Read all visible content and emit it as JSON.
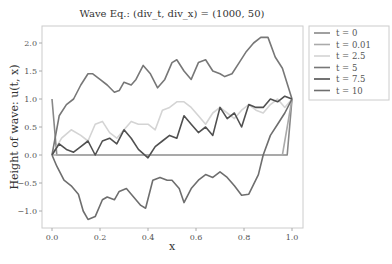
{
  "chart_data": {
    "type": "line",
    "title": "Wave Eq.: (div_t, div_x) = (1000, 50)",
    "xlabel": "x",
    "ylabel": "Height of wave: u(t, x)",
    "xlim": [
      -0.04,
      1.04
    ],
    "ylim": [
      -1.3,
      2.3
    ],
    "xticks": [
      0.0,
      0.2,
      0.4,
      0.6,
      0.8,
      1.0
    ],
    "xtick_labels": [
      "0.0",
      "0.2",
      "0.4",
      "0.6",
      "0.8",
      "1.0"
    ],
    "yticks": [
      2.0,
      1.5,
      1.0,
      0.5,
      0.0,
      -0.5,
      -1.0
    ],
    "ytick_labels": [
      "2.0",
      "1.5",
      "1.0",
      "0.5",
      "0.0",
      "−0.5",
      "−1.0"
    ],
    "grid": false,
    "legend_position": "outside upper right",
    "series": [
      {
        "name": "t = 0",
        "color": "#888888",
        "x": [
          0.0,
          0.02,
          0.98,
          1.0
        ],
        "y": [
          1.0,
          0.0,
          0.0,
          1.0
        ]
      },
      {
        "name": "t = 0.01",
        "color": "#aaaaaa",
        "x": [
          0.0,
          0.04,
          0.96,
          1.0
        ],
        "y": [
          0.0,
          0.0,
          0.0,
          1.0
        ]
      },
      {
        "name": "t = 2.5",
        "color": "#d4d4d4",
        "x": [
          0.0,
          0.04,
          0.08,
          0.12,
          0.15,
          0.18,
          0.21,
          0.24,
          0.27,
          0.3,
          0.33,
          0.36,
          0.4,
          0.43,
          0.46,
          0.49,
          0.52,
          0.55,
          0.58,
          0.61,
          0.64,
          0.67,
          0.7,
          0.73,
          0.76,
          0.79,
          0.82,
          0.85,
          0.88,
          0.91,
          0.94,
          0.97,
          1.0
        ],
        "y": [
          0.0,
          0.3,
          0.45,
          0.35,
          0.25,
          0.55,
          0.6,
          0.4,
          0.3,
          0.45,
          0.6,
          0.55,
          0.55,
          0.45,
          0.8,
          0.85,
          0.95,
          0.95,
          0.85,
          0.7,
          0.55,
          0.75,
          0.85,
          0.75,
          0.65,
          0.8,
          0.9,
          0.8,
          0.75,
          0.9,
          1.0,
          0.85,
          1.0
        ]
      },
      {
        "name": "t = 5",
        "color": "#777777",
        "x": [
          0.0,
          0.03,
          0.06,
          0.09,
          0.12,
          0.15,
          0.17,
          0.2,
          0.23,
          0.26,
          0.28,
          0.3,
          0.33,
          0.35,
          0.38,
          0.41,
          0.44,
          0.47,
          0.5,
          0.52,
          0.55,
          0.58,
          0.61,
          0.64,
          0.67,
          0.7,
          0.72,
          0.75,
          0.78,
          0.81,
          0.84,
          0.87,
          0.9,
          0.93,
          0.96,
          1.0
        ],
        "y": [
          0.0,
          0.7,
          0.9,
          1.0,
          1.25,
          1.45,
          1.45,
          1.35,
          1.25,
          1.12,
          1.15,
          1.3,
          1.25,
          1.35,
          1.6,
          1.45,
          1.2,
          1.35,
          1.65,
          1.7,
          1.5,
          1.35,
          1.65,
          1.7,
          1.5,
          1.45,
          1.4,
          1.45,
          1.65,
          1.85,
          2.0,
          2.1,
          2.1,
          1.75,
          1.55,
          1.0
        ]
      },
      {
        "name": "t = 7.5",
        "color": "#505050",
        "x": [
          0.0,
          0.03,
          0.06,
          0.09,
          0.12,
          0.15,
          0.18,
          0.21,
          0.24,
          0.27,
          0.3,
          0.33,
          0.36,
          0.4,
          0.43,
          0.46,
          0.49,
          0.52,
          0.55,
          0.58,
          0.61,
          0.64,
          0.67,
          0.7,
          0.73,
          0.76,
          0.79,
          0.82,
          0.85,
          0.88,
          0.91,
          0.94,
          0.97,
          1.0
        ],
        "y": [
          0.0,
          0.2,
          0.1,
          0.05,
          0.15,
          0.25,
          0.0,
          0.25,
          0.3,
          0.2,
          0.45,
          0.3,
          0.1,
          -0.05,
          0.15,
          0.25,
          0.35,
          0.3,
          0.7,
          0.55,
          0.4,
          0.5,
          0.35,
          0.85,
          0.65,
          0.75,
          0.5,
          0.9,
          0.85,
          0.85,
          1.0,
          0.95,
          1.05,
          1.0
        ]
      },
      {
        "name": "t = 10",
        "color": "#6e6e6e",
        "x": [
          0.0,
          0.02,
          0.05,
          0.08,
          0.11,
          0.13,
          0.15,
          0.18,
          0.21,
          0.23,
          0.26,
          0.28,
          0.31,
          0.34,
          0.37,
          0.39,
          0.42,
          0.45,
          0.48,
          0.5,
          0.53,
          0.55,
          0.58,
          0.61,
          0.64,
          0.67,
          0.7,
          0.73,
          0.76,
          0.79,
          0.82,
          0.86,
          0.88,
          0.91,
          0.94,
          0.97,
          1.0
        ],
        "y": [
          0.0,
          -0.2,
          -0.45,
          -0.55,
          -0.7,
          -1.0,
          -1.15,
          -1.1,
          -0.8,
          -0.75,
          -0.8,
          -0.65,
          -0.6,
          -0.75,
          -0.9,
          -0.95,
          -0.45,
          -0.4,
          -0.45,
          -0.45,
          -0.6,
          -0.85,
          -0.6,
          -0.45,
          -0.35,
          -0.4,
          -0.3,
          -0.4,
          -0.55,
          -0.72,
          -0.7,
          -0.35,
          0.0,
          0.35,
          0.55,
          0.75,
          1.0
        ]
      }
    ]
  },
  "legend": {
    "items": [
      {
        "label": "t = 0",
        "color": "#888888"
      },
      {
        "label": "t = 0.01",
        "color": "#aaaaaa"
      },
      {
        "label": "t = 2.5",
        "color": "#d4d4d4"
      },
      {
        "label": "t = 5",
        "color": "#777777"
      },
      {
        "label": "t = 7.5",
        "color": "#505050"
      },
      {
        "label": "t = 10",
        "color": "#6e6e6e"
      }
    ]
  }
}
